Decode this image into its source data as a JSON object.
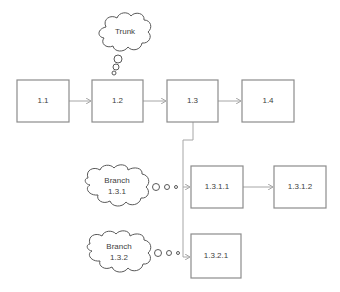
{
  "diagram": {
    "nodes": {
      "n1_1": "1.1",
      "n1_2": "1.2",
      "n1_3": "1.3",
      "n1_4": "1.4",
      "n1_3_1_1": "1.3.1.1",
      "n1_3_1_2": "1.3.1.2",
      "n1_3_2_1": "1.3.2.1"
    },
    "callouts": {
      "trunk": "Trunk",
      "branch_1_3_1_line1": "Branch",
      "branch_1_3_1_line2": "1.3.1",
      "branch_1_3_2_line1": "Branch",
      "branch_1_3_2_line2": "1.3.2"
    },
    "colors": {
      "box_border": "#8c8c8c",
      "connector": "#a6a6a6",
      "cloud_border": "#595959",
      "text": "#404040"
    }
  }
}
